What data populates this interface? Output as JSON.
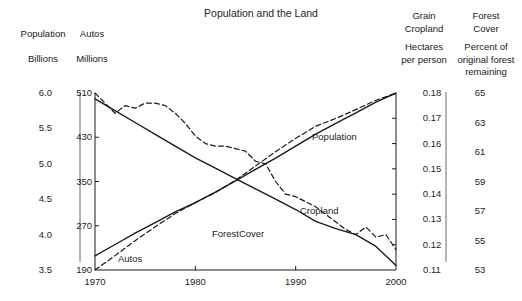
{
  "chart_data": {
    "type": "line",
    "title": "Population and the Land",
    "xlabel": "",
    "x_ticks": [
      "1970",
      "1980",
      "1990",
      "2000"
    ],
    "x_tick_values": [
      1970,
      1980,
      1990,
      2000
    ],
    "xlim": [
      1970,
      2000
    ],
    "grid": false,
    "legend": "inline-labels",
    "axes": [
      {
        "id": "population",
        "name": "Population",
        "unit": "Billions",
        "side": "left",
        "position": 1,
        "ticks": [
          "6.0",
          "5.5",
          "5.0",
          "4.5",
          "4.0",
          "3.5"
        ],
        "tick_values": [
          6.0,
          5.5,
          5.0,
          4.5,
          4.0,
          3.5
        ],
        "ylim": [
          3.5,
          6.0
        ]
      },
      {
        "id": "autos",
        "name": "Autos",
        "unit": "Millions",
        "side": "left",
        "position": 2,
        "ticks": [
          "510",
          "430",
          "350",
          "270",
          "190"
        ],
        "tick_values": [
          510,
          430,
          350,
          270,
          190
        ],
        "ylim": [
          190,
          510
        ]
      },
      {
        "id": "cropland",
        "name": "Grain Cropland",
        "unit": "Hectares per person",
        "side": "right",
        "position": 1,
        "ticks": [
          "0.18",
          "0.17",
          "0.16",
          "0.15",
          "0.14",
          "0.13",
          "0.12",
          "0.11"
        ],
        "tick_values": [
          0.18,
          0.17,
          0.16,
          0.15,
          0.14,
          0.13,
          0.12,
          0.11
        ],
        "ylim": [
          0.11,
          0.18
        ]
      },
      {
        "id": "forest",
        "name": "Forest Cover",
        "unit": "Percent of original forest remaining",
        "side": "right",
        "position": 2,
        "ticks": [
          "65",
          "63",
          "61",
          "59",
          "57",
          "55",
          "53"
        ],
        "tick_values": [
          65,
          63,
          61,
          59,
          57,
          55,
          53
        ],
        "ylim": [
          53,
          65
        ]
      }
    ],
    "series": [
      {
        "name": "Population",
        "axis": "population",
        "style": "solid",
        "label": "Population",
        "x": [
          1970,
          1972,
          1974,
          1976,
          1978,
          1980,
          1982,
          1984,
          1986,
          1988,
          1990,
          1992,
          1994,
          1996,
          1998,
          2000
        ],
        "values": [
          3.7,
          3.86,
          4.02,
          4.17,
          4.32,
          4.45,
          4.6,
          4.76,
          4.92,
          5.08,
          5.25,
          5.42,
          5.57,
          5.72,
          5.87,
          6.0
        ]
      },
      {
        "name": "Autos",
        "axis": "autos",
        "style": "dashed",
        "label": "Autos",
        "x": [
          1970,
          1972,
          1974,
          1976,
          1978,
          1980,
          1982,
          1984,
          1986,
          1988,
          1990,
          1992,
          1994,
          1996,
          1998,
          2000
        ],
        "values": [
          190,
          216,
          243,
          268,
          292,
          312,
          330,
          352,
          378,
          404,
          428,
          450,
          464,
          480,
          497,
          510
        ]
      },
      {
        "name": "Grain Cropland",
        "axis": "cropland",
        "style": "dashed",
        "label": "Cropland",
        "x": [
          1970,
          1971,
          1972,
          1973,
          1974,
          1975,
          1976,
          1977,
          1978,
          1979,
          1980,
          1981,
          1982,
          1983,
          1984,
          1985,
          1986,
          1987,
          1988,
          1989,
          1990,
          1991,
          1992,
          1993,
          1994,
          1995,
          1996,
          1997,
          1998,
          1999,
          2000
        ],
        "values": [
          0.18,
          0.176,
          0.172,
          0.175,
          0.174,
          0.176,
          0.176,
          0.175,
          0.172,
          0.168,
          0.163,
          0.16,
          0.159,
          0.159,
          0.158,
          0.157,
          0.153,
          0.152,
          0.145,
          0.14,
          0.139,
          0.137,
          0.135,
          0.132,
          0.129,
          0.126,
          0.124,
          0.127,
          0.123,
          0.124,
          0.118
        ]
      },
      {
        "name": "Forest Cover",
        "axis": "forest",
        "style": "solid",
        "label": "ForestCover",
        "x": [
          1970,
          1972,
          1974,
          1976,
          1978,
          1980,
          1982,
          1984,
          1986,
          1988,
          1990,
          1992,
          1994,
          1996,
          1998,
          2000
        ],
        "values": [
          64.6,
          63.8,
          63.0,
          62.2,
          61.4,
          60.6,
          59.9,
          59.2,
          58.5,
          57.8,
          57.1,
          56.3,
          55.8,
          55.4,
          54.6,
          53.3
        ]
      }
    ]
  },
  "headers": {
    "population": {
      "line1": "Population",
      "line2": "Billions"
    },
    "autos": {
      "line1": "Autos",
      "line2": "Millions"
    },
    "cropland": {
      "line1": "Grain",
      "line2": "Cropland",
      "line3": "Hectares",
      "line4": "per person"
    },
    "forest": {
      "line1": "Forest",
      "line2": "Cover",
      "line3": "Percent of",
      "line4": "original forest",
      "line5": "remaining"
    }
  }
}
